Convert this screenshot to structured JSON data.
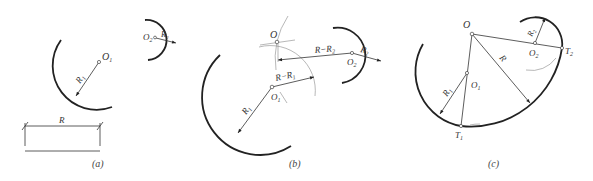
{
  "figure": {
    "panels": [
      {
        "id": "a",
        "caption": "(a)",
        "labels": {
          "O1": "O",
          "O1_sub": "1",
          "O2": "O",
          "O2_sub": "2",
          "R1": "R",
          "R1_sub": "1",
          "R2": "R",
          "R2_sub": "2",
          "R": "R"
        }
      },
      {
        "id": "b",
        "caption": "(b)",
        "labels": {
          "O": "O",
          "O1": "O",
          "O1_sub": "1",
          "O2": "O",
          "O2_sub": "2",
          "R1": "R",
          "R1_sub": "1",
          "R2": "R",
          "R2_sub": "2",
          "R_minus_R1": "R−R",
          "R_minus_R1_sub": "1",
          "R_minus_R2": "R−R",
          "R_minus_R2_sub": "2"
        }
      },
      {
        "id": "c",
        "caption": "(c)",
        "labels": {
          "O": "O",
          "O1": "O",
          "O1_sub": "1",
          "O2": "O",
          "O2_sub": "2",
          "R": "R",
          "R1": "R",
          "R1_sub": "1",
          "R2": "R",
          "R2_sub": "2",
          "T1": "T",
          "T1_sub": "1",
          "T2": "T",
          "T2_sub": "2"
        }
      }
    ]
  }
}
